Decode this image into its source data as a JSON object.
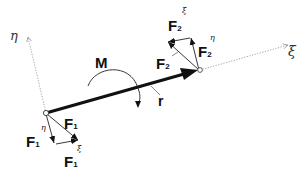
{
  "diagram": {
    "axes": {
      "eta": {
        "label": "η",
        "color": "#888888",
        "style": "dotted"
      },
      "xi": {
        "label": "ξ",
        "color": "#888888",
        "style": "dotted"
      }
    },
    "moment": {
      "label": "M"
    },
    "position_vector": {
      "label": "r"
    },
    "forces": {
      "F1": {
        "base": "F",
        "index": "1"
      },
      "F1_eta": {
        "base": "F",
        "index": "1",
        "superscript": "η"
      },
      "F1_xi": {
        "base": "F",
        "index": "1",
        "superscript": "ξ"
      },
      "F2": {
        "base": "F",
        "index": "2"
      },
      "F2_eta": {
        "base": "F",
        "index": "2",
        "superscript": "η"
      },
      "F2_xi": {
        "base": "F",
        "index": "2",
        "superscript": "ξ"
      }
    },
    "colors": {
      "line": "#111111",
      "axis": "#999999",
      "background": "#ffffff"
    }
  }
}
